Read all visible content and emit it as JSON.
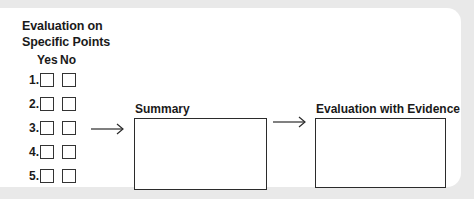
{
  "checklist": {
    "title_line1": "Evaluation on",
    "title_line2": "Specific Points",
    "col_yes": "Yes",
    "col_no": "No",
    "items": [
      {
        "num": "1."
      },
      {
        "num": "2."
      },
      {
        "num": "3."
      },
      {
        "num": "4."
      },
      {
        "num": "5."
      }
    ]
  },
  "summary": {
    "label": "Summary"
  },
  "evaluation": {
    "label": "Evaluation with Evidence"
  },
  "colors": {
    "background": "#e9e9e9",
    "panel": "#ffffff",
    "stroke": "#2b2b2b"
  }
}
